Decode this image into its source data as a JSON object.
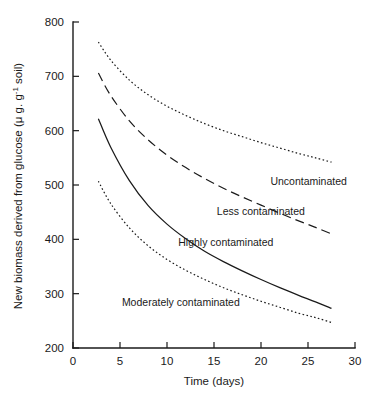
{
  "chart_data": {
    "type": "line",
    "title": "",
    "xlabel": "Time (days)",
    "ylabel": "New biomass derived from glucose (μ g. g",
    "ylabel_sup": "-1",
    "ylabel_tail": " soil)",
    "xlim": [
      0,
      30
    ],
    "ylim": [
      200,
      800
    ],
    "xticks": [
      0,
      5,
      10,
      15,
      20,
      25,
      30
    ],
    "xtick_labels": [
      "0",
      "5",
      "10",
      "15",
      "20",
      "25",
      "30"
    ],
    "yticks": [
      200,
      300,
      400,
      500,
      600,
      700,
      800
    ],
    "ytick_labels": [
      "200",
      "300",
      "400",
      "500",
      "600",
      "700",
      "800"
    ],
    "grid": false,
    "legend_position": "inline-annotations",
    "line_color": "#1a1a1a",
    "series": [
      {
        "name": "Uncontaminated",
        "style": "dotted",
        "label_x": 21.0,
        "label_y": 500,
        "x": [
          2.7,
          4,
          6,
          8,
          10,
          12,
          14,
          16,
          18,
          20,
          22,
          24,
          25.8,
          27.5
        ],
        "values": [
          763,
          730,
          693,
          666,
          645,
          628,
          613,
          600,
          589,
          578,
          568,
          558,
          550,
          542
        ]
      },
      {
        "name": "Less contaminated",
        "style": "dashed",
        "label_x": 15.3,
        "label_y": 444,
        "x": [
          2.7,
          4,
          6,
          8,
          10,
          12,
          14,
          16,
          18,
          20,
          22,
          24,
          25.8,
          27.5
        ],
        "values": [
          706,
          665,
          618,
          583,
          555,
          532,
          512,
          494,
          478,
          463,
          448,
          434,
          422,
          410
        ]
      },
      {
        "name": "Highly contaminated",
        "style": "solid",
        "label_x": 11.2,
        "label_y": 387,
        "x": [
          2.7,
          4,
          6,
          8,
          10,
          12,
          14,
          16,
          18,
          20,
          22,
          24,
          25.8,
          27.5
        ],
        "values": [
          622,
          570,
          508,
          462,
          428,
          401,
          378,
          359,
          342,
          326,
          311,
          297,
          285,
          273
        ]
      },
      {
        "name": "Moderately contaminated",
        "style": "dotted",
        "label_x": 5.2,
        "label_y": 278,
        "x": [
          2.7,
          4,
          6,
          8,
          10,
          12,
          14,
          16,
          18,
          20,
          22,
          24,
          25.8,
          27.5
        ],
        "values": [
          507,
          466,
          421,
          388,
          363,
          343,
          326,
          311,
          298,
          286,
          275,
          264,
          256,
          247
        ]
      }
    ]
  }
}
